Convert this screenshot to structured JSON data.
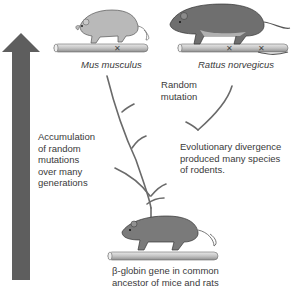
{
  "labels": {
    "mouse_species": "Mus musculus",
    "rat_species": "Rattus norvegicus",
    "random_mutation": [
      "Random",
      "mutation"
    ],
    "accumulation": [
      "Accumulation",
      "of random",
      "mutations",
      "over many",
      "generations"
    ],
    "divergence": [
      "Evolutionary divergence",
      "produced many species",
      "of rodents."
    ],
    "ancestor": [
      "β-globin gene in common",
      "ancestor of mice and rats"
    ]
  },
  "colors": {
    "arrow": "#5e5e5e",
    "mouse_body": "#b9b9b9",
    "rat_body": "#6f6f6f",
    "ancestor_body": "#7a7a7a",
    "gene_bar": "#c8c8c8",
    "branch": "#6a6a6a"
  }
}
